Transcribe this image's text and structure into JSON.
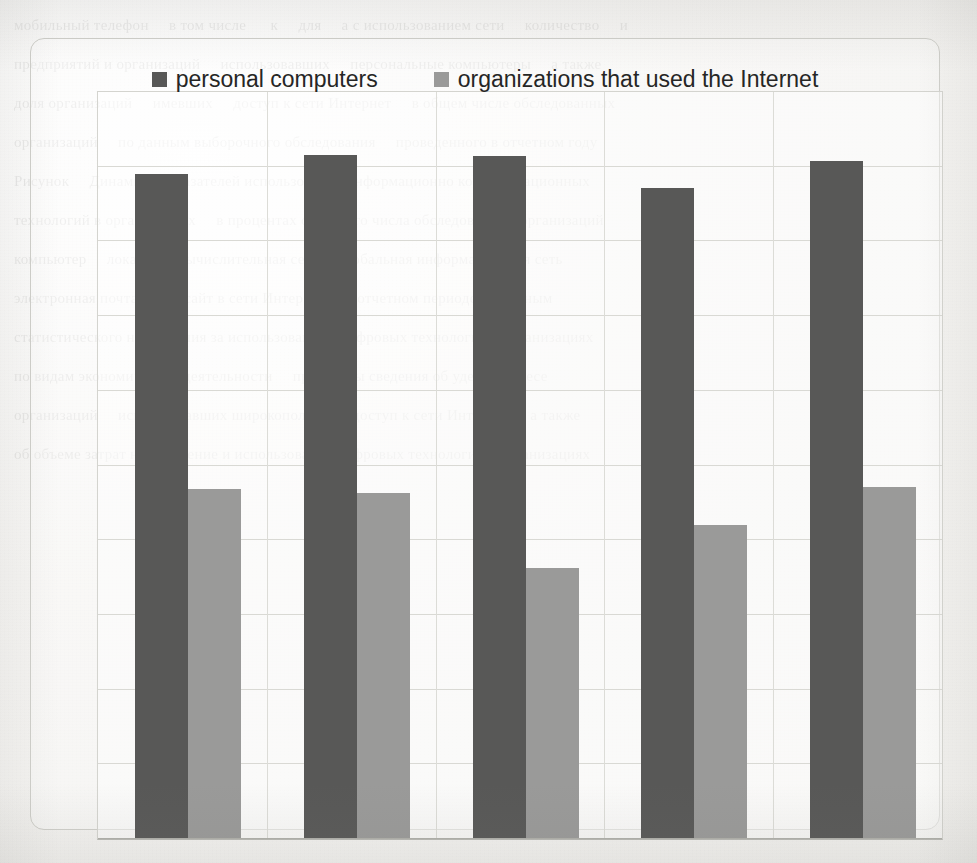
{
  "page": {
    "background_color": "#f4f3f1",
    "ghost_text": "мобильный телефон     в том числе      к     для     а с использованием сети     количество     и\nпредприятий и организаций     использовавших     персональные компьютеры     а также\nдоля организаций     имевших     доступ к сети Интернет     в общем числе обследованных\nорганизаций     по данным выборочного обследования     проведенного в отчетном году\nРисунок     Динамика показателей использования информационно коммуникационных\nтехнологий в организациях     в процентах от общего числа обследованных организаций\nкомпьютер     локальная вычислительная сеть     глобальная информационная сеть\nэлектронная почта     веб сайт в сети Интернет     в отчетном периоде по данным\nстатистического наблюдения за использованием цифровых технологий в организациях\nпо видам экономической деятельности     приведены сведения об удельном весе\nорганизаций     использовавших широкополосный доступ к сети Интернет     а также\nоб объеме затрат на внедрение и использование цифровых технологий в организациях"
  },
  "chart": {
    "frame": {
      "border_color": "#cfcfca",
      "radius_px": 14
    },
    "plot": {
      "border_color": "#d4d4cf",
      "gridline_color": "#d9d9d4",
      "baseline_color": "#b0b0aa"
    },
    "legend": {
      "position": "top-center",
      "items": [
        {
          "label": "personal computers",
          "color": "#585857",
          "swatch_name": "legend-swatch-personal-computers"
        },
        {
          "label": "organizations that used the Internet",
          "color": "#9a9a99",
          "swatch_name": "legend-swatch-organizations-internet"
        }
      ]
    }
  },
  "chart_data": {
    "type": "bar",
    "title": "",
    "subtitle": "",
    "xlabel": "",
    "ylabel": "",
    "categories": [
      "1",
      "2",
      "3",
      "4",
      "5"
    ],
    "tick_labels_visible": false,
    "axis_labels_visible": false,
    "grid": true,
    "gridline_values": [
      10,
      20,
      30,
      40,
      50,
      60,
      70,
      80,
      90
    ],
    "ylim": [
      0,
      100
    ],
    "xlim": [
      0,
      5
    ],
    "legend_position": "top-center",
    "series": [
      {
        "name": "personal computers",
        "color": "#585857",
        "values": [
          89.0,
          91.5,
          91.4,
          87.1,
          90.7
        ]
      },
      {
        "name": "organizations that used the Internet",
        "color": "#9a9a99",
        "values": [
          46.9,
          46.3,
          36.3,
          42.1,
          47.1
        ]
      }
    ]
  }
}
